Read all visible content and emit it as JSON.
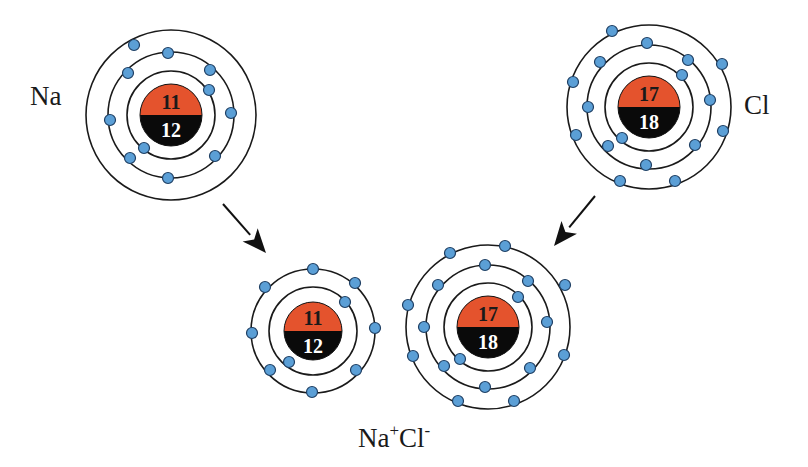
{
  "colors": {
    "proton": "#E4532D",
    "neutron": "#0a0a0a",
    "electron": "#5B9FD6",
    "electron_stroke": "#1f3f63",
    "shell": "#1a1a1a",
    "arrow": "#111111"
  },
  "labels": {
    "na": "Na",
    "cl": "Cl",
    "product_base1": "Na",
    "product_sup1": "+",
    "product_base2": "Cl",
    "product_sup2": "-"
  },
  "atoms": [
    {
      "id": "na-atom",
      "label": "Na",
      "center": [
        171,
        115
      ],
      "protons": "11",
      "neutrons": "12",
      "nucleus_r": 31,
      "shells": [
        44,
        63,
        85
      ],
      "electrons": [
        [
          209,
          90
        ],
        [
          144,
          148
        ],
        [
          168,
          53
        ],
        [
          128,
          73
        ],
        [
          210,
          70
        ],
        [
          110,
          120
        ],
        [
          231,
          113
        ],
        [
          130,
          158
        ],
        [
          215,
          156
        ],
        [
          168,
          178
        ],
        [
          134,
          45
        ]
      ]
    },
    {
      "id": "cl-atom",
      "label": "Cl",
      "center": [
        649,
        107
      ],
      "protons": "17",
      "neutrons": "18",
      "nucleus_r": 31,
      "shells": [
        44,
        62,
        82
      ],
      "electrons": [
        [
          682,
          75
        ],
        [
          622,
          138
        ],
        [
          647,
          43
        ],
        [
          600,
          62
        ],
        [
          688,
          60
        ],
        [
          710,
          100
        ],
        [
          588,
          107
        ],
        [
          608,
          146
        ],
        [
          695,
          145
        ],
        [
          646,
          165
        ],
        [
          612,
          31
        ],
        [
          722,
          64
        ],
        [
          573,
          82
        ],
        [
          576,
          135
        ],
        [
          723,
          131
        ],
        [
          620,
          181
        ],
        [
          675,
          181
        ]
      ]
    },
    {
      "id": "na-ion",
      "label": "Na+",
      "center": [
        313,
        331
      ],
      "protons": "11",
      "neutrons": "12",
      "nucleus_r": 29,
      "shells": [
        44,
        62
      ],
      "electrons": [
        [
          345,
          302
        ],
        [
          289,
          362
        ],
        [
          313,
          269
        ],
        [
          265,
          287
        ],
        [
          355,
          283
        ],
        [
          252,
          333
        ],
        [
          375,
          328
        ],
        [
          270,
          370
        ],
        [
          356,
          370
        ],
        [
          312,
          392
        ]
      ]
    },
    {
      "id": "cl-ion",
      "label": "Cl-",
      "center": [
        488,
        327
      ],
      "protons": "17",
      "neutrons": "18",
      "nucleus_r": 31,
      "shells": [
        44,
        62,
        82
      ],
      "electrons": [
        [
          518,
          297
        ],
        [
          460,
          359
        ],
        [
          485,
          265
        ],
        [
          438,
          285
        ],
        [
          528,
          281
        ],
        [
          424,
          327
        ],
        [
          547,
          322
        ],
        [
          444,
          366
        ],
        [
          530,
          368
        ],
        [
          485,
          387
        ],
        [
          450,
          253
        ],
        [
          505,
          246
        ],
        [
          408,
          305
        ],
        [
          565,
          285
        ],
        [
          413,
          356
        ],
        [
          564,
          355
        ],
        [
          458,
          401
        ],
        [
          514,
          401
        ]
      ]
    }
  ],
  "arrows": [
    {
      "id": "arrow-na-to-ion",
      "from": [
        223,
        204
      ],
      "to": [
        266,
        253
      ]
    },
    {
      "id": "arrow-cl-to-ion",
      "from": [
        595,
        196
      ],
      "to": [
        554,
        246
      ]
    }
  ]
}
